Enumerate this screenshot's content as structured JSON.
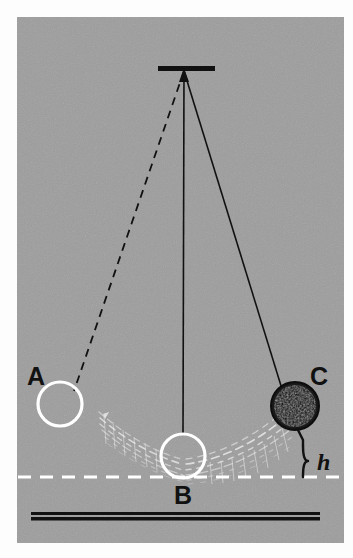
{
  "figure": {
    "kind": "physics-diagram",
    "background_color": "#9d9d9d",
    "page_color": "#fdfdfd",
    "ink_color": "#111111",
    "highlight_color": "#ffffff",
    "canvas": {
      "x": 17,
      "y": 17,
      "width": 327,
      "height": 526
    }
  },
  "labels": {
    "position_a": "A",
    "position_b": "B",
    "position_c": "C",
    "height": "h"
  },
  "pivot": {
    "name": "ceiling-bracket",
    "x": 184,
    "y": 70,
    "bar_x1": 158,
    "bar_x2": 215
  },
  "strings": [
    {
      "name": "string-to-a",
      "style": "dashed",
      "x1": 184,
      "y1": 71,
      "x2": 74,
      "y2": 391
    },
    {
      "name": "string-to-b",
      "style": "solid",
      "x1": 184,
      "y1": 71,
      "x2": 183,
      "y2": 434
    },
    {
      "name": "string-to-c",
      "style": "solid",
      "x1": 184,
      "y1": 71,
      "x2": 282,
      "y2": 389
    }
  ],
  "bobs": [
    {
      "name": "bob-a",
      "label": "A",
      "cx": 60,
      "cy": 404,
      "r": 22,
      "fill": "none",
      "stroke": "#ffffff"
    },
    {
      "name": "bob-b",
      "label": "B",
      "cx": 183,
      "cy": 456,
      "r": 22,
      "fill": "none",
      "stroke": "#ffffff"
    },
    {
      "name": "bob-c",
      "label": "C",
      "cx": 295,
      "cy": 406,
      "r": 24,
      "fill": "#1a1a1a",
      "stroke": "#1a1a1a"
    }
  ],
  "reference_line": {
    "name": "lowest-point-level",
    "style": "dashed",
    "color": "#ffffff",
    "y": 477,
    "x1": 18,
    "x2": 343
  },
  "ground_line": {
    "name": "ground-bar",
    "color": "#111111",
    "y": 516,
    "x1": 31,
    "x2": 320
  },
  "height_marker": {
    "name": "height-brace",
    "label": "h",
    "top_y": 446,
    "bottom_y": 477,
    "x": 308,
    "label_x": 322,
    "label_y": 466
  },
  "motion_blur": {
    "name": "swing-trail",
    "color": "#ffffff",
    "description": "white streaked arc trails between bob A/B and bob B/C showing the swinging motion"
  }
}
